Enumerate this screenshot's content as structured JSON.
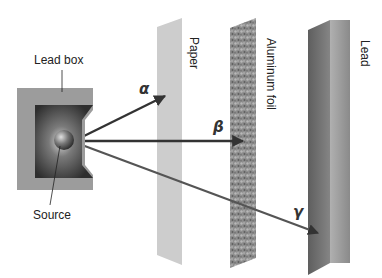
{
  "diagram": {
    "labels": {
      "lead_box": "Lead box",
      "source": "Source",
      "paper": "Paper",
      "aluminum_foil": "Aluminum foil",
      "lead": "Lead"
    },
    "rays": [
      {
        "id": "alpha",
        "symbol": "α",
        "stopped_by": "Paper"
      },
      {
        "id": "beta",
        "symbol": "β",
        "stopped_by": "Aluminum foil"
      },
      {
        "id": "gamma",
        "symbol": "γ",
        "stopped_by": "Lead"
      }
    ],
    "colors": {
      "ray": "#3a3a3a",
      "lead_box": "#9a9a9a",
      "paper": "#cfcfcf",
      "foil": "#8c8c8c",
      "lead_face": "#6f6f6f",
      "lead_side": "#a8a8a8"
    }
  }
}
